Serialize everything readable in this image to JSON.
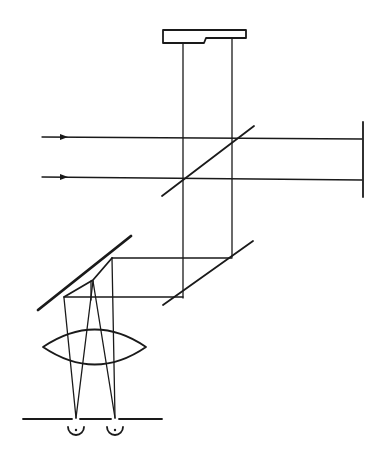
{
  "diagram": {
    "type": "optical-schematic",
    "description": "Interferometer-style optical layout: two incoming parallel beams, beam splitter, reference mirror, top reference block, fold mirror, angled mirror, convex lens focusing onto two points on a baseline",
    "colors": {
      "stroke": "#1a1a1a",
      "background": "#ffffff"
    },
    "elements": {
      "top_block": {
        "label": ""
      },
      "input_beams": {
        "count": 2,
        "direction": "right"
      },
      "right_mirror": {
        "label": ""
      },
      "beam_splitter": {
        "label": ""
      },
      "lower_mirror": {
        "label": ""
      },
      "angled_mirror": {
        "label": ""
      },
      "lens": {
        "label": ""
      },
      "baseline": {
        "label": ""
      },
      "focal_points": {
        "count": 2
      }
    }
  }
}
